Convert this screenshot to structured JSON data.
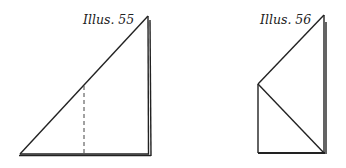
{
  "illustrations": [
    {
      "label": "Illus. 55",
      "description": "Right triangle folded paper with vertical dashed fold line"
    },
    {
      "label": "Illus. 56",
      "description": "Folded paper shape: upper triangle on top of rectangle with diagonal"
    }
  ],
  "colors": {
    "line": "#222222",
    "background": "#ffffff"
  }
}
